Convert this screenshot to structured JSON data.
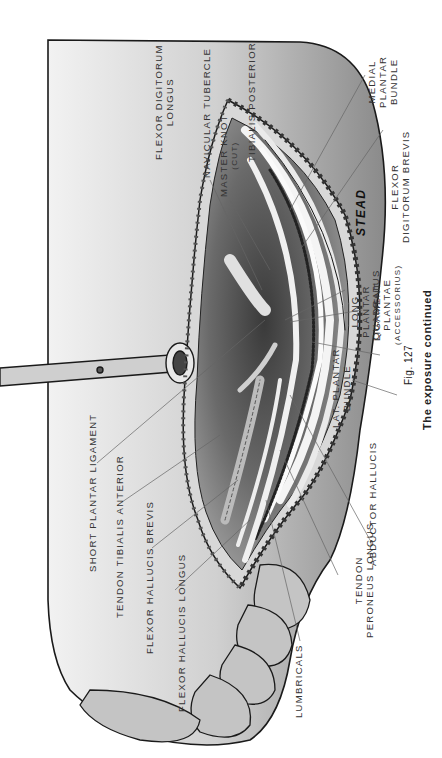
{
  "figure": {
    "number": "Fig. 127",
    "caption": "The exposure continued",
    "artist_signature": "STEAD"
  },
  "labels": {
    "medial_plantar_bundle": [
      "MEDIAL",
      "PLANTAR",
      "BUNDLE"
    ],
    "flexor_digitorum_brevis": [
      "FLEXOR",
      "DIGITORUM BREVIS"
    ],
    "quadratus_plantae": [
      "QUADRATUS",
      "PLANTAE",
      "(ACCESSORIUS)"
    ],
    "long_plantar_ligament": [
      "LONG",
      "PLANTAR",
      "LIGAMENT"
    ],
    "lat_plantar_bundle": [
      "LAT. PLANTAR",
      "BUNDLE"
    ],
    "abductor_hallucis": [
      "ABDUCTOR HALLUCIS"
    ],
    "tendon_peroneus_longus": [
      "TENDON",
      "PERONEUS LONGUS"
    ],
    "lumbricals": [
      "LUMBRICALS"
    ],
    "flexor_hallucis_longus": [
      "FLEXOR HALLUCIS LONGUS"
    ],
    "flexor_hallucis_brevis": [
      "FLEXOR HALLUCIS BREVIS"
    ],
    "tendon_tibialis_anterior": [
      "TENDON TIBIALIS ANTERIOR"
    ],
    "short_plantar_ligament": [
      "SHORT PLANTAR LIGAMENT"
    ],
    "navicular_tubercle": [
      "NAVICULAR TUBERCLE"
    ],
    "master_knot": [
      "MASTER KNOT",
      "(CUT)"
    ],
    "tibialis_posterior": [
      "TIBIALIS POSTERIOR"
    ],
    "flexor_digitorum_longus": [
      "FLEXOR DIGITORUM",
      "LONGUS"
    ]
  },
  "colors": {
    "background": "#ffffff",
    "skin_light": "#e6e6e6",
    "skin_mid": "#b8b8b8",
    "skin_dark": "#5a5a5a",
    "outline": "#1a1a1a",
    "leader_line": "#666666"
  }
}
